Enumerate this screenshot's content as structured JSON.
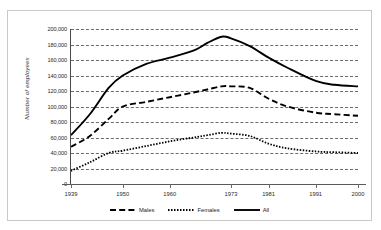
{
  "figure": {
    "top_caption": "",
    "background_color": "#ffffff",
    "frame_color": "#c9c9c9",
    "ink_color": "#000000"
  },
  "axes": {
    "y_title": "Number of employees",
    "y_tick_labels": [
      "200,000",
      "180,000",
      "160,000",
      "140,000",
      "120,000",
      "100,000",
      "80,000",
      "60,000",
      "40,000",
      "20,000",
      "0"
    ],
    "x_tick_labels": [
      "1939",
      "1950",
      "1960",
      "1973",
      "1981",
      "1991",
      "2000"
    ]
  },
  "legend": {
    "position": "bottom",
    "items": [
      {
        "label": "Males",
        "style": "dashed"
      },
      {
        "label": "Females",
        "style": "dotted"
      },
      {
        "label": "All",
        "style": "solid"
      }
    ]
  },
  "chart_data": {
    "type": "line",
    "title": "",
    "subtitle": "",
    "xlabel": "",
    "ylabel": "Number of employees",
    "xlim": [
      1939,
      2000
    ],
    "ylim": [
      0,
      200000
    ],
    "ytick_step": 20000,
    "grid": true,
    "legend_position": "bottom",
    "xtick_values": [
      1939,
      1950,
      1960,
      1973,
      1981,
      1991,
      2000
    ],
    "xtick_labels": [
      "1939",
      "1950",
      "1960",
      "1973",
      "1981",
      "1991",
      "2000"
    ],
    "x": [
      1939,
      1943,
      1947,
      1950,
      1955,
      1960,
      1965,
      1968,
      1971,
      1973,
      1977,
      1981,
      1985,
      1991,
      1995,
      2000
    ],
    "series": [
      {
        "name": "Males",
        "style": "dashed",
        "color": "#000000",
        "values": [
          48000,
          62000,
          84000,
          100000,
          106000,
          112000,
          118000,
          122000,
          126000,
          126000,
          124000,
          110000,
          100000,
          92000,
          90000,
          88000
        ]
      },
      {
        "name": "Females",
        "style": "dotted",
        "color": "#000000",
        "values": [
          17000,
          28000,
          40000,
          43000,
          49000,
          55000,
          60000,
          63000,
          66000,
          65000,
          62000,
          52000,
          46000,
          42000,
          41000,
          40000
        ]
      },
      {
        "name": "All",
        "style": "solid",
        "color": "#000000",
        "values": [
          63000,
          90000,
          124000,
          140000,
          155000,
          163000,
          172000,
          182000,
          190000,
          188000,
          178000,
          163000,
          150000,
          133000,
          128000,
          126000
        ]
      }
    ]
  }
}
